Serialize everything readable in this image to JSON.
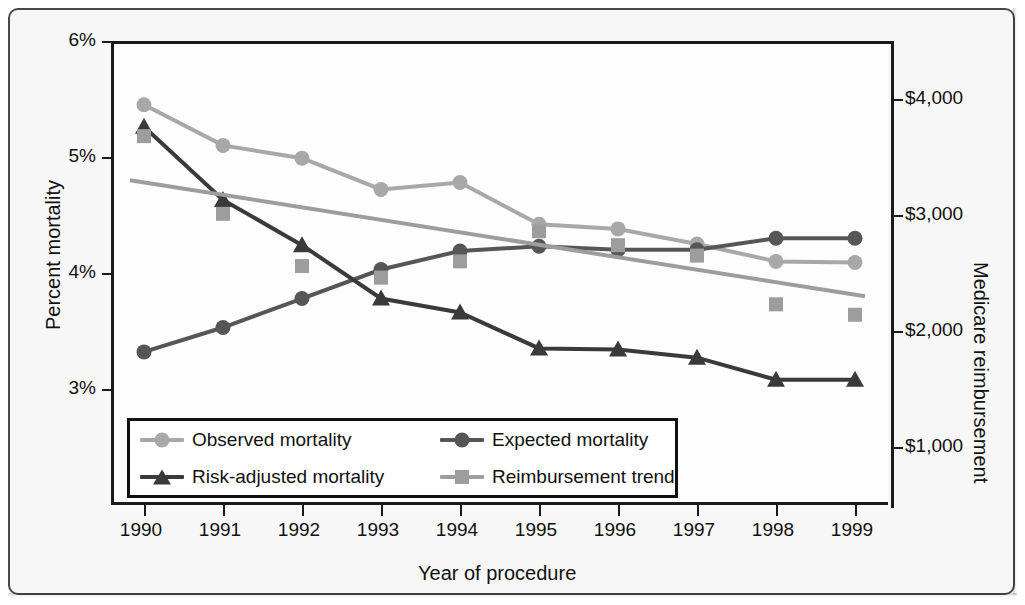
{
  "chart_data": {
    "type": "line",
    "title": "",
    "xlabel": "Year of procedure",
    "ylabel": "Percent mortality",
    "y2label": "Medicare reimbursement",
    "categories": [
      "1990",
      "1991",
      "1992",
      "1993",
      "1994",
      "1995",
      "1996",
      "1997",
      "1998",
      "1999"
    ],
    "x": [
      1990,
      1991,
      1992,
      1993,
      1994,
      1995,
      1996,
      1997,
      1998,
      1999
    ],
    "ylim": [
      2.0,
      6.0
    ],
    "y2lim": [
      500,
      4500
    ],
    "yticks": [
      "3%",
      "4%",
      "5%",
      "6%"
    ],
    "ytick_values": [
      3,
      4,
      5,
      6
    ],
    "y2ticks": [
      "$1,000",
      "$2,000",
      "$3,000",
      "$4,000"
    ],
    "y2tick_values": [
      1000,
      2000,
      3000,
      4000
    ],
    "grid": false,
    "legend_position": "inside-bottom-left",
    "series": [
      {
        "name": "Observed mortality",
        "axis": "left",
        "color": "#a8a8a8",
        "marker": "circle",
        "values": [
          5.45,
          5.1,
          4.99,
          4.72,
          4.78,
          4.42,
          4.38,
          4.25,
          4.1,
          4.09
        ]
      },
      {
        "name": "Expected mortality",
        "axis": "left",
        "color": "#565656",
        "marker": "circle",
        "values": [
          3.32,
          3.53,
          3.78,
          4.03,
          4.19,
          4.23,
          4.2,
          4.2,
          4.3,
          4.3
        ]
      },
      {
        "name": "Risk-adjusted mortality",
        "axis": "left",
        "color": "#3a3a3a",
        "marker": "triangle",
        "values": [
          5.26,
          4.63,
          4.24,
          3.78,
          3.66,
          3.35,
          3.34,
          3.27,
          3.08,
          3.08
        ]
      },
      {
        "name": "Reimbursement trend",
        "axis": "right",
        "color": "#9d9d9d",
        "marker": "square",
        "scatter_only": true,
        "trendline": {
          "start": 3300,
          "end": 2300,
          "color": "#9d9d9d"
        },
        "values": [
          3680,
          3010,
          2560,
          2460,
          2600,
          2860,
          2740,
          2650,
          2230,
          2140
        ]
      }
    ]
  },
  "legend": {
    "items": [
      {
        "label": "Observed mortality",
        "marker": "circle",
        "color": "#a8a8a8"
      },
      {
        "label": "Expected mortality",
        "marker": "circle",
        "color": "#565656"
      },
      {
        "label": "Risk-adjusted mortality",
        "marker": "triangle",
        "color": "#3a3a3a"
      },
      {
        "label": "Reimbursement trend",
        "marker": "square",
        "color": "#9d9d9d"
      }
    ]
  },
  "axes": {
    "y_title": "Percent mortality",
    "y2_title": "Medicare reimbursement",
    "x_title": "Year of procedure"
  }
}
